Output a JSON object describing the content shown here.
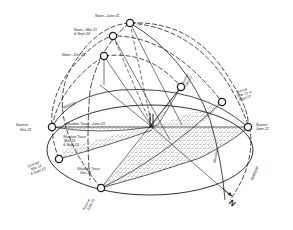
{
  "diagram": {
    "colors": {
      "ink": "#1a1a1a",
      "paper": "#ffffff",
      "stipple": "#555555"
    },
    "labels": {
      "noon_june": "Noon - June 21",
      "noon_mar_l1": "Noon - Mar 21",
      "noon_mar_l2": "& Sept 23",
      "noon_dec": "Noon - Dec 21",
      "sunset_dec_l1": "Sunset",
      "sunset_dec_l2": "Dec 21",
      "sunset_mar_l1": "Sunset",
      "sunset_mar_l2": "Mar 21 &",
      "sunset_mar_l3": "Sept 23",
      "sunset_june_l1": "Sunset",
      "sunset_june_l2": "June 21",
      "sunrise_dec_l1": "Sunrise",
      "sunrise_dec_l2": "Dec 21",
      "sunrise_mar_l1": "Sunrise",
      "sunrise_mar_l2": "Mar 21",
      "sunrise_mar_l3": "& Sept 23",
      "sunrise_june_l1": "Sunrise",
      "sunrise_june_l2": "June 21",
      "horizon_upper": "Horizon",
      "horizon_right": "Horizon",
      "meridian": "Meridian",
      "shadow_june": "Shadow Trace - June 21",
      "shadow_mar_l1": "Shadow Trace",
      "shadow_mar_l2": "Mar 21",
      "shadow_mar_l3": "& Sept 23",
      "shadow_dec_l1": "Shadow Trace",
      "shadow_dec_l2": "Dec 21",
      "north": "N"
    },
    "sun_positions": [
      {
        "name": "noon-june-21",
        "x": 130,
        "y": 23
      },
      {
        "name": "noon-mar-sept",
        "x": 113,
        "y": 36
      },
      {
        "name": "noon-dec-21",
        "x": 104,
        "y": 56
      },
      {
        "name": "sunset-dec-21",
        "x": 181,
        "y": 87
      },
      {
        "name": "sunset-mar-sept",
        "x": 222,
        "y": 102
      },
      {
        "name": "sunset-june-21",
        "x": 248,
        "y": 127
      },
      {
        "name": "sunrise-dec-21",
        "x": 52,
        "y": 127
      },
      {
        "name": "sunrise-mar-sept",
        "x": 59,
        "y": 159
      },
      {
        "name": "sunrise-june-21",
        "x": 101,
        "y": 188
      }
    ]
  }
}
